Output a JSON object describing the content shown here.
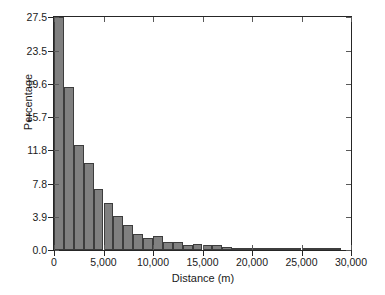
{
  "chart_data": {
    "type": "bar",
    "title": "",
    "subtitle": "",
    "xlabel": "Distance (m)",
    "ylabel": "Percentage",
    "xlim": [
      0,
      30000
    ],
    "ylim": [
      0,
      27.5
    ],
    "grid": false,
    "legend": null,
    "annotations": [],
    "bin_width": 1000,
    "bar_color": "#808080",
    "bar_edge_color": "#3d3d3d",
    "axis_color": "#262626",
    "xticks": [
      0,
      5000,
      10000,
      15000,
      20000,
      25000,
      30000
    ],
    "xtick_labels": [
      "0",
      "5,000",
      "10,000",
      "15,000",
      "20,000",
      "25,000",
      "30,000"
    ],
    "yticks": [
      0.0,
      3.9,
      7.8,
      11.8,
      15.7,
      19.6,
      23.5,
      27.5
    ],
    "ytick_labels": [
      "0.0",
      "3.9",
      "7.8",
      "11.8",
      "15.7",
      "19.6",
      "23.5",
      "27.5"
    ],
    "bin_starts": [
      0,
      1000,
      2000,
      3000,
      4000,
      5000,
      6000,
      7000,
      8000,
      9000,
      10000,
      11000,
      12000,
      13000,
      14000,
      15000,
      16000,
      17000,
      18000,
      19000,
      20000,
      21000,
      22000,
      23000,
      24000,
      25000,
      26000,
      27000,
      28000,
      29000
    ],
    "categories": [
      "0-1,000",
      "1,000-2,000",
      "2,000-3,000",
      "3,000-4,000",
      "4,000-5,000",
      "5,000-6,000",
      "6,000-7,000",
      "7,000-8,000",
      "8,000-9,000",
      "9,000-10,000",
      "10,000-11,000",
      "11,000-12,000",
      "12,000-13,000",
      "13,000-14,000",
      "14,000-15,000",
      "15,000-16,000",
      "16,000-17,000",
      "17,000-18,000",
      "18,000-19,000",
      "19,000-20,000",
      "20,000-21,000",
      "21,000-22,000",
      "22,000-23,000",
      "23,000-24,000",
      "24,000-25,000",
      "25,000-26,000",
      "26,000-27,000",
      "27,000-28,000",
      "28,000-29,000",
      "29,000-30,000"
    ],
    "values": [
      27.5,
      19.2,
      12.4,
      10.3,
      7.2,
      5.6,
      4.0,
      2.9,
      1.9,
      1.4,
      1.6,
      0.9,
      1.0,
      0.6,
      0.7,
      0.6,
      0.6,
      0.3,
      0.2,
      0.15,
      0.2,
      0.1,
      0.15,
      0.05,
      0.2,
      0.05,
      0.05,
      0.05,
      0.03,
      0.0
    ]
  }
}
